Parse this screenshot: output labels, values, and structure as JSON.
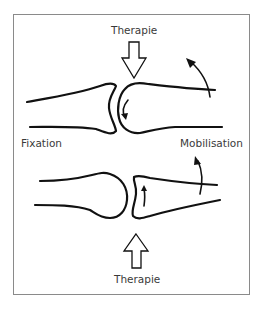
{
  "figure": {
    "type": "joint-mobilization-diagram",
    "labels": {
      "therapy_top": "Therapie",
      "therapy_bottom": "Therapie",
      "fixation": "Fixation",
      "mobilisation": "Mobilisation"
    },
    "panels": [
      {
        "position": "top",
        "force_direction": "down",
        "force_label": "Therapie",
        "convex_part": "mobilised bone (right)",
        "glide_direction": "down",
        "rotation_direction": "up"
      },
      {
        "position": "bottom",
        "force_direction": "up",
        "force_label": "Therapie",
        "concave_part": "mobilised bone (right)",
        "glide_direction": "up",
        "rotation_direction": "up"
      }
    ],
    "colors": {
      "stroke": "#111111",
      "frame": "#8a8a8a",
      "text": "#3a3a3a",
      "background": "#ffffff"
    }
  }
}
